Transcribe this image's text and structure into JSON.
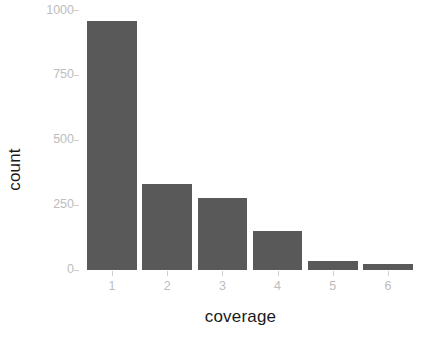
{
  "chart_data": {
    "type": "bar",
    "title": "",
    "subtitle": "",
    "xlabel": "coverage",
    "ylabel": "count",
    "categories": [
      "1",
      "2",
      "3",
      "4",
      "5",
      "6"
    ],
    "values": [
      960,
      332,
      277,
      150,
      36,
      24
    ],
    "series": [
      {
        "name": "count",
        "values": [
          960,
          332,
          277,
          150,
          36,
          24
        ]
      }
    ],
    "xlim": [
      0.4,
      6.6
    ],
    "ylim": [
      0,
      1010
    ],
    "yticks": [
      0,
      250,
      500,
      750,
      1000
    ],
    "ytick_labels": [
      "0",
      "250",
      "500",
      "750",
      "1000"
    ],
    "xtick_labels": [
      "1",
      "2",
      "3",
      "4",
      "5",
      "6"
    ],
    "grid": false,
    "legend": false,
    "legend_position": "none",
    "annotations": [],
    "style": {
      "bar_fill": "#595959",
      "panel_background": "#ffffff",
      "tick_label_color": "#bdbdbd",
      "axis_title_color": "#1a1a1a",
      "tick_mark_color": "#cfcfcf"
    }
  }
}
